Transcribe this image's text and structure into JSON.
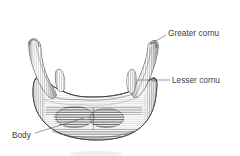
{
  "figure": {
    "view": "anterior",
    "style": "pen-and-ink stipple and hatch anatomical illustration",
    "background_color": "#ffffff",
    "ink_color": "#2e2e32",
    "label_color": "#3b3b3f",
    "width": 240,
    "height": 156
  },
  "labels": [
    {
      "id": "greater-cornu",
      "text": "Greater cornu",
      "x": 168,
      "y": 29,
      "leader": {
        "x1": 166,
        "y1": 35,
        "x2": 151,
        "y2": 44
      }
    },
    {
      "id": "lesser-cornu",
      "text": "Lesser cornu",
      "x": 172,
      "y": 76,
      "leader": {
        "x1": 170,
        "y1": 80,
        "x2": 140,
        "y2": 80
      }
    },
    {
      "id": "body",
      "text": "Body",
      "x": 12,
      "y": 131,
      "leader": {
        "x1": 35,
        "y1": 133,
        "x2": 84,
        "y2": 118
      }
    }
  ],
  "anatomy": {
    "body": "broad U-shaped central bar with dense horizontal hatching",
    "greater_cornu_left": "tall tapering horn curving up and outward on the left",
    "greater_cornu_right": "tall tapering horn curving up and outward on the right",
    "lesser_cornu_left": "small conical nub at the left superior body margin",
    "lesser_cornu_right": "small conical nub at the right superior body margin"
  }
}
